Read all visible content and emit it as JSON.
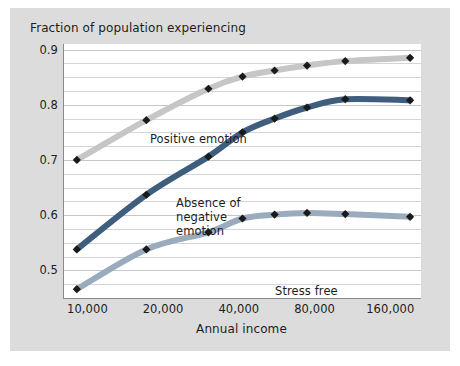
{
  "chart_data": {
    "type": "line",
    "title": "Fraction of population experiencing",
    "xlabel": "Annual income",
    "ylabel": "",
    "xscale": "log2",
    "xticks": [
      10000,
      20000,
      40000,
      80000,
      160000
    ],
    "xticklabels": [
      "10,000",
      "20,000",
      "40,000",
      "80,000",
      "160,000"
    ],
    "xlim": [
      8000,
      210000
    ],
    "yticks": [
      0.5,
      0.6,
      0.7,
      0.8,
      0.9
    ],
    "yticklabels": [
      "0.5",
      "0.6",
      "0.7",
      "0.8",
      "0.9"
    ],
    "ylim": [
      0.45,
      0.91
    ],
    "minor_gridline_step": 0.025,
    "grid": true,
    "legend_position": "inline-annotations",
    "marker": "diamond",
    "marker_color": "#1a1a1a",
    "x": [
      9000,
      17000,
      30000,
      41000,
      55000,
      74000,
      105000,
      190000
    ],
    "series": [
      {
        "name": "Positive emotion",
        "color": "#c6c6c6",
        "annotation": "Positive emotion",
        "values": [
          0.7,
          0.772,
          0.829,
          0.851,
          0.862,
          0.871,
          0.879,
          0.885
        ]
      },
      {
        "name": "Absence of negative emotion",
        "color": "#3f5d7d",
        "annotation": "Absence of\nnegative\nemotion",
        "values": [
          0.538,
          0.637,
          0.706,
          0.75,
          0.775,
          0.795,
          0.81,
          0.808
        ]
      },
      {
        "name": "Stress free",
        "color": "#9aabbd",
        "annotation": "Stress free",
        "values": [
          0.466,
          0.538,
          0.569,
          0.594,
          0.601,
          0.604,
          0.602,
          0.597
        ]
      }
    ]
  },
  "figure": {
    "background": "#ffffff",
    "panel_background": "#dcdcdc",
    "plot_background": "#ffffff",
    "axis_color": "#8a8a8a",
    "grid_color": "#d2d6da",
    "text_color": "#1d1d1d"
  }
}
